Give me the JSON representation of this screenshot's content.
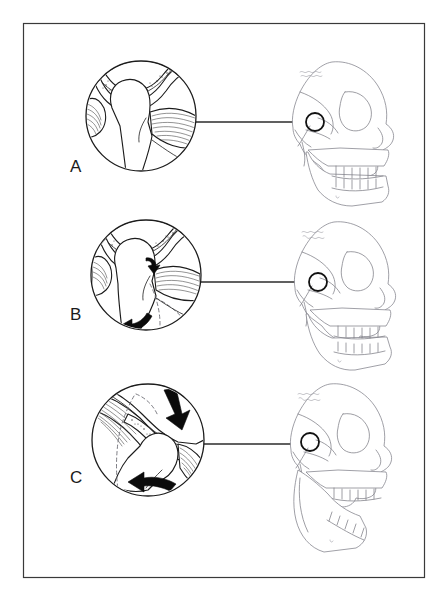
{
  "figure": {
    "border_color": "#3a3a3a",
    "background_color": "#ffffff",
    "ink_color": "#1c1c1c",
    "skull_color": "#7e7e86",
    "arrow_color": "#0b0b0b"
  },
  "panels": [
    {
      "id": "A",
      "label": "A",
      "label_x": 70,
      "label_y": 172,
      "caption": "Closed position: condyle seated in glenoid fossa with articular disc interposed; teeth in occlusion",
      "detail_circle": {
        "cx": 141,
        "cy": 116,
        "r": 55
      },
      "marker_circle": {
        "cx": 315,
        "cy": 122,
        "r": 9
      },
      "leader_line": {
        "x1": 196,
        "y1": 122,
        "x2": 306,
        "y2": 122
      },
      "arrows": [],
      "jaw_state": "closed",
      "skull": {
        "x": 280,
        "y": 55,
        "jaw_rotation": 0
      }
    },
    {
      "id": "B",
      "label": "B",
      "label_x": 70,
      "label_y": 320,
      "caption": "Early opening: pure rotation of the condyle within the fossa; mandible swings downward",
      "detail_circle": {
        "cx": 146,
        "cy": 275,
        "r": 55
      },
      "marker_circle": {
        "cx": 318,
        "cy": 282,
        "r": 9
      },
      "leader_line": {
        "x1": 201,
        "y1": 282,
        "x2": 309,
        "y2": 282
      },
      "arrows": [
        {
          "name": "condyle-rotation-arrow",
          "type": "small-curved",
          "direction": "clockwise"
        },
        {
          "name": "mandible-rotation-arrow",
          "type": "large-curved",
          "direction": "down-left"
        }
      ],
      "jaw_state": "partially-open",
      "skull": {
        "x": 282,
        "y": 215,
        "jaw_rotation": 8
      }
    },
    {
      "id": "C",
      "label": "C",
      "label_x": 70,
      "label_y": 483,
      "caption": "Maximum opening: condyle translates anteriorly down the articular eminence with continued rotation",
      "detail_circle": {
        "cx": 148,
        "cy": 440,
        "r": 56
      },
      "marker_circle": {
        "cx": 310,
        "cy": 442,
        "r": 9
      },
      "leader_line": {
        "x1": 204,
        "y1": 444,
        "x2": 301,
        "y2": 444
      },
      "arrows": [
        {
          "name": "disc-translation-arrow",
          "type": "large-straight",
          "direction": "down-right"
        },
        {
          "name": "mandible-translation-arrow",
          "type": "large-curved",
          "direction": "left"
        }
      ],
      "jaw_state": "wide-open",
      "skull": {
        "x": 278,
        "y": 378,
        "jaw_rotation": 20
      }
    }
  ],
  "frame": {
    "x": 23,
    "y": 23,
    "width": 401,
    "height": 554
  }
}
